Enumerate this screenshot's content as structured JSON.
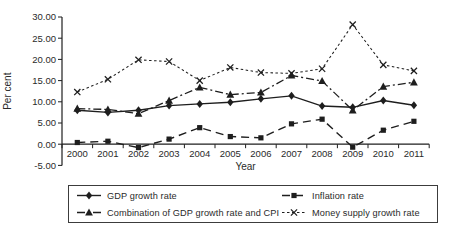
{
  "chart_data": {
    "type": "line",
    "title": "",
    "xlabel": "Year",
    "ylabel": "Per cent",
    "x": [
      2000,
      2001,
      2002,
      2003,
      2004,
      2005,
      2006,
      2007,
      2008,
      2009,
      2010,
      2011
    ],
    "ylim": [
      -5,
      30
    ],
    "ytick_step": 5,
    "ytick_labels": [
      "30.00",
      "25.00",
      "20.00",
      "15.00",
      "10.00",
      "5.00",
      "0.00",
      "-5.00"
    ],
    "grid": false,
    "legend_position": "bottom-box-two-columns",
    "series": [
      {
        "name": "GDP growth rate",
        "marker": "diamond",
        "line_style": "solid",
        "values": [
          8.0,
          7.5,
          8.0,
          9.1,
          9.5,
          9.9,
          10.7,
          11.4,
          9.0,
          8.7,
          10.3,
          9.2
        ]
      },
      {
        "name": "Inflation rate",
        "marker": "square",
        "line_style": "dashed",
        "values": [
          0.4,
          0.7,
          -0.8,
          1.2,
          3.9,
          1.8,
          1.5,
          4.8,
          5.9,
          -0.7,
          3.3,
          5.4
        ]
      },
      {
        "name": "Combination of GDP growth rate and CPI",
        "marker": "triangle",
        "line_style": "dashdot",
        "values": [
          8.4,
          8.2,
          7.2,
          10.3,
          13.4,
          11.7,
          12.2,
          16.2,
          14.9,
          8.0,
          13.6,
          14.6
        ]
      },
      {
        "name": "Money supply growth rate",
        "marker": "x",
        "line_style": "dotted",
        "values": [
          12.3,
          15.3,
          19.9,
          19.5,
          15.0,
          18.1,
          16.9,
          16.7,
          17.8,
          28.2,
          18.7,
          17.3
        ]
      }
    ]
  },
  "colors": {
    "ink": "#1e1e1e",
    "background": "#ffffff",
    "legend_border": "#3c3c3c"
  }
}
